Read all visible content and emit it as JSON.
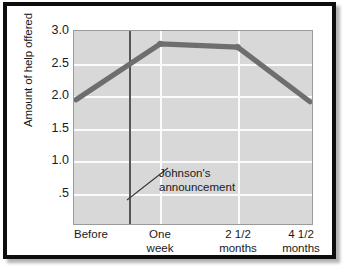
{
  "chart_data": {
    "type": "line",
    "title": "",
    "xlabel": "",
    "ylabel": "Amount of help offered",
    "categories": [
      "Before",
      "One week",
      "2 1/2 months",
      "4 1/2 months"
    ],
    "values": [
      1.93,
      2.8,
      2.75,
      1.9
    ],
    "series": [
      {
        "name": "Amount of help offered",
        "values": [
          1.93,
          2.8,
          2.75,
          1.9
        ]
      }
    ],
    "ylim": [
      0.0,
      3.0
    ],
    "yticks": [
      3.0,
      2.5,
      2.0,
      1.5,
      1.0,
      0.5
    ],
    "ytick_labels": [
      "3.0",
      "2.5",
      "2.0",
      "1.5",
      "1.0",
      ".5"
    ],
    "grid": true,
    "legend": "none",
    "annotations": [
      {
        "text_lines": [
          "Johnson's",
          "announcement"
        ],
        "marker": "vertical-line",
        "x_position_between": [
          "Before",
          "One week"
        ]
      }
    ],
    "colors": {
      "line": "#6e6e6e",
      "plot_background": "#d8d8d8",
      "gridline": "#fbfbfb",
      "annotation_line": "#565656",
      "text": "#1a1a1a",
      "frame": "#0d0d0d"
    }
  },
  "xtick_labels": [
    {
      "line1": "Before",
      "line2": ""
    },
    {
      "line1": "One",
      "line2": "week"
    },
    {
      "line1": "2 1/2",
      "line2": "months"
    },
    {
      "line1": "4 1/2",
      "line2": "months"
    }
  ],
  "annotation": {
    "line1": "Johnson's",
    "line2": "announcement"
  }
}
